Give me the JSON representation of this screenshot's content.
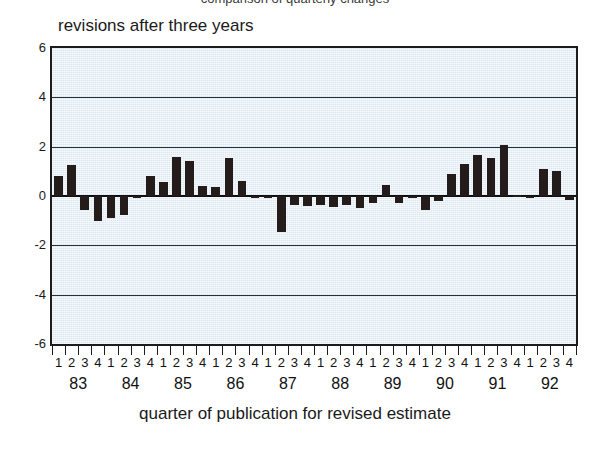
{
  "figure": {
    "top_caption": "comparison of quarterly changes",
    "title": "revisions after three years",
    "x_axis_title": "quarter of publication for revised estimate",
    "colors": {
      "plot_background": "#dbe7f0",
      "bar": "#241c1a",
      "gridline": "#23313c",
      "axis": "#1c1c1c",
      "text": "#1a1a1a"
    }
  },
  "chart_data": {
    "type": "bar",
    "title": "revisions after three years",
    "xlabel": "quarter of publication for revised estimate",
    "ylabel": "",
    "ylim": [
      -6,
      6
    ],
    "yticks": [
      6,
      4,
      2,
      0,
      -2,
      -4,
      -6
    ],
    "ytick_labels": [
      "6",
      "4",
      "2",
      "0",
      "-2",
      "-4",
      "-6"
    ],
    "grid": true,
    "legend": "none",
    "years": [
      "83",
      "84",
      "85",
      "86",
      "87",
      "88",
      "89",
      "90",
      "91",
      "92"
    ],
    "quarters": [
      "1",
      "2",
      "3",
      "4"
    ],
    "categories": [
      "83Q1",
      "83Q2",
      "83Q3",
      "83Q4",
      "84Q1",
      "84Q2",
      "84Q3",
      "84Q4",
      "85Q1",
      "85Q2",
      "85Q3",
      "85Q4",
      "86Q1",
      "86Q2",
      "86Q3",
      "86Q4",
      "87Q1",
      "87Q2",
      "87Q3",
      "87Q4",
      "88Q1",
      "88Q2",
      "88Q3",
      "88Q4",
      "89Q1",
      "89Q2",
      "89Q3",
      "89Q4",
      "90Q1",
      "90Q2",
      "90Q3",
      "90Q4",
      "91Q1",
      "91Q2",
      "91Q3",
      "91Q4",
      "92Q1",
      "92Q2",
      "92Q3",
      "92Q4"
    ],
    "values": [
      0.8,
      1.25,
      -0.55,
      -1.0,
      -0.9,
      -0.75,
      -0.1,
      0.8,
      0.55,
      1.6,
      1.4,
      0.4,
      0.35,
      1.55,
      0.6,
      -0.1,
      -0.05,
      -1.45,
      -0.35,
      -0.4,
      -0.35,
      -0.45,
      -0.35,
      -0.5,
      -0.3,
      0.45,
      -0.3,
      -0.1,
      -0.55,
      -0.2,
      0.9,
      1.3,
      1.65,
      1.55,
      2.05,
      0.05,
      0.0,
      1.1,
      1.0,
      -0.15
    ]
  }
}
